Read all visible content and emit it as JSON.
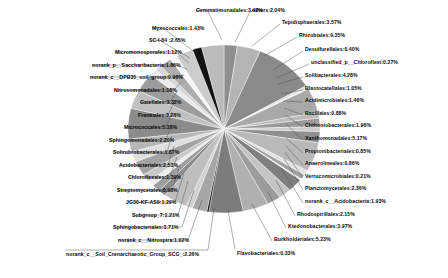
{
  "chart_data": {
    "type": "pie",
    "title": "",
    "xlabel": "",
    "ylabel": "",
    "legend_position": "none",
    "grid": false,
    "label_format": "name:percent",
    "categories": [
      "others",
      "Tepidisphaerales",
      "Rhizobiales",
      "Desulfurellales",
      "unclassified_p__Chloroflexi",
      "Solibacterales",
      "Blastocatellales",
      "Acidimicrobiales",
      "Bacillales",
      "Chthoniobacterales",
      "Xanthomonadales",
      "Propionibacteriales",
      "Anaerolineales",
      "Verrucomicrobiales",
      "Planctomycetales",
      "norank_c__Acidobacteria",
      "Rhodospirillales",
      "Ktedonobacterales",
      "Burkholderiales",
      "Flavobacteriales",
      "norank_c__Soil_Crenarchaeotic_Group_SCG_",
      "norank_c__Nitrospira",
      "Sphingobacteriales",
      "Subgroup_7",
      "JG30-KF-AS9",
      "Streptomycetales",
      "Chloroflexales",
      "Acidobacteriales",
      "Solirubrobacterales",
      "Sphingomonadales",
      "Micrococcales",
      "Frankiales",
      "Gaiellales",
      "Nitrosomonadales",
      "norank_c__DPB35_soil_group",
      "norank_p__Saccharibacteria",
      "Micromonosporales",
      "SC-I-84",
      "Myxococcales",
      "Gemmatimonadales"
    ],
    "values": [
      2.04,
      3.57,
      9.35,
      0.4,
      0.27,
      4.28,
      1.05,
      1.46,
      0.88,
      1.96,
      5.17,
      0.85,
      0.86,
      0.21,
      2.36,
      1.93,
      2.15,
      3.97,
      5.23,
      0.33,
      2.26,
      1.02,
      3.71,
      1.21,
      1.29,
      0.98,
      1.39,
      2.53,
      1.87,
      2.2,
      5.38,
      3.28,
      3.32,
      1.18,
      0.96,
      1.86,
      1.12,
      2.65,
      1.43,
      3.42
    ],
    "slice_colors": [
      "#8e8e8e",
      "#b4b4b4",
      "#8a8a8a",
      "#d8d8d8",
      "#f2f2f2",
      "#a8a8a8",
      "#bcbcbc",
      "#9a9a9a",
      "#cfcfcf",
      "#8f8f8f",
      "#b9b9b9",
      "#e2e2e2",
      "#a0a0a0",
      "#f4f4f4",
      "#7f7f7f",
      "#c4c4c4",
      "#9c9c9c",
      "#b0b0b0",
      "#7c7c7c",
      "#1a1a1a",
      "#a6a6a6",
      "#d2d2d2",
      "#bebebe",
      "#8c8c8c",
      "#9f9f9f",
      "#ededed",
      "#c8c8c8",
      "#a3a3a3",
      "#dedede",
      "#b6b6b6",
      "#8b8b8b",
      "#c0c0c0",
      "#9d9d9d",
      "#eaeaea",
      "#d6d6d6",
      "#adadad",
      "#f7f7f7",
      "#cccccc",
      "#121212",
      "#bbbbbb"
    ],
    "labels": [
      {
        "text": "Gemmatimonadales:3.42%",
        "side": "top-left"
      },
      {
        "text": "Myxococcales:1.43%",
        "side": "left"
      },
      {
        "text": "SC-I-84 :2.65%",
        "side": "left"
      },
      {
        "text": "Micromonosporales:1.12%",
        "side": "left"
      },
      {
        "text": "norank_p__Saccharibacteria:1.86%",
        "side": "left"
      },
      {
        "text": "norank_c__DPB35_soil_group:0.96%",
        "side": "left"
      },
      {
        "text": "Nitrosomonadales:1.18%",
        "side": "left"
      },
      {
        "text": "Gaiellales:3.32%",
        "side": "left"
      },
      {
        "text": "Frankiales:3.28%",
        "side": "left"
      },
      {
        "text": "Micrococcales:5.38%",
        "side": "left"
      },
      {
        "text": "Sphingomonadales:2.20%",
        "side": "left"
      },
      {
        "text": "Solirubrobacterales:1.87%",
        "side": "left"
      },
      {
        "text": "Acidobacteriales:2.53%",
        "side": "left"
      },
      {
        "text": "Chloroflexales:1.39%",
        "side": "left"
      },
      {
        "text": "Streptomycetales:0.98%",
        "side": "left"
      },
      {
        "text": "JG30-KF-AS9:1.29%",
        "side": "left"
      },
      {
        "text": "Subgroup_7:1.21%",
        "side": "left"
      },
      {
        "text": "Sphingobacteriales:3.71%",
        "side": "left"
      },
      {
        "text": "norank_c__Nitrospira:1.02%",
        "side": "left"
      },
      {
        "text": "norank_c__Soil_Crenarchaeotic_Group_SCG_:2.26%",
        "side": "bottom"
      },
      {
        "text": "Flavobacteriales:0.33%",
        "side": "bottom-right"
      },
      {
        "text": "Burkholderiales:5.23%",
        "side": "right"
      },
      {
        "text": "Ktedonobacterales:3.97%",
        "side": "right"
      },
      {
        "text": "Rhodospirillales:2.15%",
        "side": "right"
      },
      {
        "text": "norank_c__Acidobacteria:1.93%",
        "side": "right"
      },
      {
        "text": "Planctomycetales:2.36%",
        "side": "right"
      },
      {
        "text": "Verrucomicrobiales:0.21%",
        "side": "right"
      },
      {
        "text": "Anaerolineales:0.86%",
        "side": "right"
      },
      {
        "text": "Propionibacteriales:0.85%",
        "side": "right"
      },
      {
        "text": "Xanthomonadales:5.17%",
        "side": "right"
      },
      {
        "text": "Chthoniobacterales:1.96%",
        "side": "right"
      },
      {
        "text": "Bacillales:0.88%",
        "side": "right"
      },
      {
        "text": "Acidimicrobiales:1.46%",
        "side": "right"
      },
      {
        "text": "Blastocatellales:1.05%",
        "side": "right"
      },
      {
        "text": "Solibacterales:4.28%",
        "side": "right"
      },
      {
        "text": "unclassified_p__Chloroflexi:0.27%",
        "side": "right"
      },
      {
        "text": "Desulfurellales:0.40%",
        "side": "right"
      },
      {
        "text": "Rhizobiales:9.35%",
        "side": "top-right"
      },
      {
        "text": "Tepidisphaerales:3.57%",
        "side": "top-right"
      },
      {
        "text": "others:2.04%",
        "side": "top-right"
      }
    ]
  },
  "labels_left": [
    {
      "text": "Gemmatimonadales:3.42%",
      "x": 196,
      "y": 8,
      "tx": 207,
      "ty": 10,
      "ex": 222,
      "ey": 40
    },
    {
      "text": "Myxococcales:1.43%",
      "x": 152,
      "y": 26,
      "tx": 163,
      "ty": 28,
      "ex": 196,
      "ey": 53
    },
    {
      "text": "SC-I-84 :2.65%",
      "x": 149,
      "y": 38,
      "tx": 159,
      "ty": 40,
      "ex": 190,
      "ey": 58
    },
    {
      "text": "Micromonosporales:1.12%",
      "x": 115,
      "y": 50,
      "tx": 176,
      "ty": 52,
      "ex": 189,
      "ey": 63
    },
    {
      "text": "norank_p__Saccharibacteria:1.86%",
      "x": 92,
      "y": 63,
      "tx": 176,
      "ty": 65,
      "ex": 187,
      "ey": 69
    },
    {
      "text": "norank_c__DPB35_soil_group:0.96%",
      "x": 90,
      "y": 75,
      "tx": 176,
      "ty": 77,
      "ex": 184,
      "ey": 75
    },
    {
      "text": "Nitrosomonadales:1.18%",
      "x": 114,
      "y": 88,
      "tx": 174,
      "ty": 90,
      "ex": 181,
      "ey": 82
    },
    {
      "text": "Gaiellales:3.32%",
      "x": 140,
      "y": 100,
      "tx": 170,
      "ty": 102,
      "ex": 178,
      "ey": 90
    },
    {
      "text": "Frankiales:3.28%",
      "x": 138,
      "y": 113,
      "tx": 168,
      "ty": 115,
      "ex": 175,
      "ey": 100
    },
    {
      "text": "Micrococcales:5.38%",
      "x": 124,
      "y": 125,
      "tx": 166,
      "ty": 127,
      "ex": 172,
      "ey": 112
    },
    {
      "text": "Sphingomonadales:2.20%",
      "x": 109,
      "y": 138,
      "tx": 166,
      "ty": 140,
      "ex": 171,
      "ey": 126
    },
    {
      "text": "Solirubrobacterales:1.87%",
      "x": 113,
      "y": 150,
      "tx": 167,
      "ty": 152,
      "ex": 172,
      "ey": 136
    },
    {
      "text": "Acidobacteriales:2.53%",
      "x": 119,
      "y": 163,
      "tx": 168,
      "ty": 165,
      "ex": 174,
      "ey": 146
    },
    {
      "text": "Chloroflexales:1.39%",
      "x": 128,
      "y": 175,
      "tx": 170,
      "ty": 177,
      "ex": 177,
      "ey": 157
    },
    {
      "text": "Streptomycetales:0.98%",
      "x": 117,
      "y": 188,
      "tx": 172,
      "ty": 190,
      "ex": 180,
      "ey": 165
    },
    {
      "text": "JG30-KF-AS9:1.29%",
      "x": 126,
      "y": 200,
      "tx": 175,
      "ty": 202,
      "ex": 184,
      "ey": 173
    },
    {
      "text": "Subgroup_7:1.21%",
      "x": 132,
      "y": 213,
      "tx": 178,
      "ty": 215,
      "ex": 188,
      "ey": 181
    },
    {
      "text": "Sphingobacteriales:3.71%",
      "x": 113,
      "y": 225,
      "tx": 182,
      "ty": 227,
      "ex": 194,
      "ey": 190
    },
    {
      "text": "norank_c__Nitrospira:1.02%",
      "x": 118,
      "y": 238,
      "tx": 188,
      "ty": 240,
      "ex": 202,
      "ey": 200
    },
    {
      "text": "norank_c__Soil_Crenarchaeotic_Group_SCG_:2.26%",
      "x": 66,
      "y": 252,
      "tx": 208,
      "ty": 250,
      "ex": 214,
      "ey": 208
    }
  ],
  "labels_right": [
    {
      "text": "others:2.04%",
      "x": 252,
      "y": 8,
      "tx": 250,
      "ty": 12,
      "ex": 235,
      "ey": 42
    },
    {
      "text": "Tepidisphaerales:3.57%",
      "x": 282,
      "y": 20,
      "tx": 280,
      "ty": 24,
      "ex": 252,
      "ey": 46
    },
    {
      "text": "Rhizobiales:9.35%",
      "x": 299,
      "y": 33,
      "tx": 297,
      "ty": 37,
      "ex": 264,
      "ey": 56
    },
    {
      "text": "Desulfurellales:0.40%",
      "x": 305,
      "y": 47,
      "tx": 303,
      "ty": 51,
      "ex": 273,
      "ey": 70
    },
    {
      "text": "unclassified_p__Chloroflexi:0.27%",
      "x": 311,
      "y": 60,
      "tx": 309,
      "ty": 64,
      "ex": 276,
      "ey": 78
    },
    {
      "text": "Solibacterales:4.28%",
      "x": 305,
      "y": 73,
      "tx": 303,
      "ty": 77,
      "ex": 278,
      "ey": 84
    },
    {
      "text": "Blastocatellales:1.05%",
      "x": 305,
      "y": 86,
      "tx": 303,
      "ty": 90,
      "ex": 281,
      "ey": 94
    },
    {
      "text": "Acidimicrobiales:1.46%",
      "x": 305,
      "y": 98,
      "tx": 303,
      "ty": 102,
      "ex": 283,
      "ey": 101
    },
    {
      "text": "Bacillales:0.88%",
      "x": 305,
      "y": 111,
      "tx": 303,
      "ty": 115,
      "ex": 284,
      "ey": 108
    },
    {
      "text": "Chthoniobacterales:1.96%",
      "x": 305,
      "y": 123,
      "tx": 303,
      "ty": 127,
      "ex": 285,
      "ey": 115
    },
    {
      "text": "Xanthomonadales:5.17%",
      "x": 305,
      "y": 136,
      "tx": 303,
      "ty": 140,
      "ex": 286,
      "ey": 124
    },
    {
      "text": "Propionibacteriales:0.85%",
      "x": 305,
      "y": 149,
      "tx": 303,
      "ty": 153,
      "ex": 286,
      "ey": 138
    },
    {
      "text": "Anaerolineales:0.86%",
      "x": 305,
      "y": 161,
      "tx": 303,
      "ty": 165,
      "ex": 286,
      "ey": 146
    },
    {
      "text": "Verrucomicrobiales:0.21%",
      "x": 305,
      "y": 174,
      "tx": 303,
      "ty": 178,
      "ex": 285,
      "ey": 152
    },
    {
      "text": "Planctomycetales:2.36%",
      "x": 305,
      "y": 186,
      "tx": 303,
      "ty": 190,
      "ex": 284,
      "ey": 158
    },
    {
      "text": "norank_c__Acidobacteria:1.93%",
      "x": 305,
      "y": 199,
      "tx": 303,
      "ty": 203,
      "ex": 281,
      "ey": 168
    },
    {
      "text": "Rhodospirillales:2.15%",
      "x": 297,
      "y": 212,
      "tx": 295,
      "ty": 216,
      "ex": 276,
      "ey": 180
    },
    {
      "text": "Ktedonobacterales:3.97%",
      "x": 288,
      "y": 224,
      "tx": 286,
      "ty": 228,
      "ex": 268,
      "ey": 192
    },
    {
      "text": "Burkholderiales:5.23%",
      "x": 274,
      "y": 237,
      "tx": 272,
      "ty": 241,
      "ex": 252,
      "ey": 204
    },
    {
      "text": "Flavobacteriales:0.33%",
      "x": 237,
      "y": 251,
      "tx": 235,
      "ty": 249,
      "ex": 228,
      "ey": 210
    }
  ],
  "pie": {
    "center_x": 224,
    "center_y": 129,
    "radius_x": 96,
    "radius_y": 84,
    "start_angle_deg": -90,
    "direction": "clockwise"
  }
}
